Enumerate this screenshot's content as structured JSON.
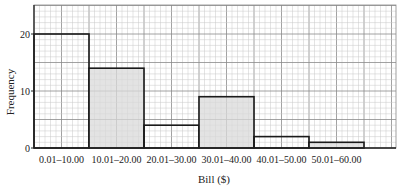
{
  "chart_data": {
    "type": "bar",
    "title": "",
    "xlabel": "Bill ($)",
    "ylabel": "Frequency",
    "categories": [
      "0.01–10.00",
      "10.01–20.00",
      "20.01–30.00",
      "30.01–40.00",
      "40.01–50.00",
      "50.01–60.00"
    ],
    "values": [
      20,
      14,
      4,
      9,
      2,
      1
    ],
    "shaded": [
      false,
      true,
      false,
      true,
      false,
      true
    ],
    "ylim": [
      0,
      25
    ],
    "yticks": [
      0,
      10,
      20
    ],
    "grid": true,
    "legend": null
  },
  "colors": {
    "grid_minor": "#c8c8c8",
    "grid_major": "#8a8a8a",
    "bar_outline": "#1a1a1a",
    "bar_shaded": "#d9d9d9",
    "bar_unshaded": "none"
  }
}
